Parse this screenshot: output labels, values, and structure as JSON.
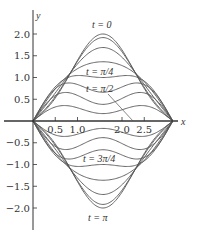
{
  "chart_data": {
    "type": "line",
    "title": "",
    "xlabel": "x",
    "ylabel": "y",
    "xlim": [
      0,
      3.14159
    ],
    "ylim": [
      -2.4,
      2.5
    ],
    "grid": false,
    "legend": "none (inline curve labels)",
    "x_ticks": [
      "0.5",
      "1.0",
      "2.0",
      "2.5"
    ],
    "y_ticks": [
      "2.0",
      "1.5",
      "1.0",
      "0.5",
      "-0.5",
      "-1.0",
      "-1.5",
      "-2.0"
    ],
    "function": "u(x,t) = 1.707 sin(x) cos(t) - 0.293 sin(3x) cos(3t)",
    "t_values": [
      "0",
      "π/16",
      "π/8",
      "3π/16",
      "π/4",
      "5π/16",
      "3π/8",
      "7π/16",
      "π/2",
      "9π/16",
      "5π/8",
      "11π/16",
      "3π/4",
      "13π/16",
      "7π/8",
      "15π/16",
      "π"
    ],
    "series": [
      {
        "name": "t = 0",
        "peak": 2.0
      },
      {
        "name": "t = π/4",
        "value_flat": 1.0
      },
      {
        "name": "t = π/2",
        "value_flat": 0.0
      },
      {
        "name": "t = 3π/4",
        "value_flat": -1.0
      },
      {
        "name": "t = π",
        "peak": -2.0
      }
    ],
    "annotations": [
      "t = 0",
      "t = π/4",
      "t = π/2",
      "t = 3π/4",
      "t = π"
    ]
  },
  "labels": {
    "x_axis": "x",
    "y_axis": "y",
    "t0": "t = 0",
    "t_pi4": "t = π/4",
    "t_pi2": "t = π/2",
    "t_3pi4": "t = 3π/4",
    "t_pi": "t = π"
  },
  "ticks": {
    "x": [
      "0.5",
      "1.0",
      "2.0",
      "2.5"
    ],
    "y": [
      "2.0",
      "1.5",
      "1.0",
      "0.5",
      "-0.5",
      "-1.0",
      "-1.5",
      "-2.0"
    ]
  },
  "colors": {
    "curve": "#555555",
    "axis": "#333333"
  }
}
